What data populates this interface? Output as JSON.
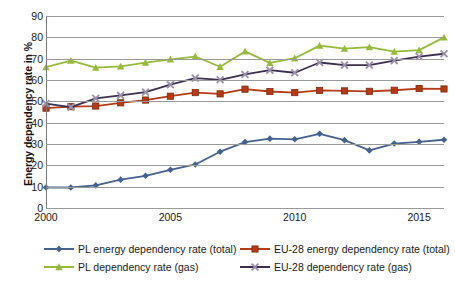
{
  "chart_data": {
    "type": "line",
    "title": "",
    "xlabel": "",
    "ylabel": "Energy dependency rate in %",
    "x": [
      2000,
      2001,
      2002,
      2003,
      2004,
      2005,
      2006,
      2007,
      2008,
      2009,
      2010,
      2011,
      2012,
      2013,
      2014,
      2015,
      2016
    ],
    "xtick_labels": [
      "2000",
      "2005",
      "2010",
      "2015"
    ],
    "xtick_values": [
      2000,
      2005,
      2010,
      2015
    ],
    "ytick_labels": [
      "0",
      "10",
      "20",
      "30",
      "40",
      "50",
      "60",
      "70",
      "80",
      "90"
    ],
    "ytick_values": [
      0,
      10,
      20,
      30,
      40,
      50,
      60,
      70,
      80,
      90
    ],
    "ylim": [
      0,
      90
    ],
    "xlim": [
      2000,
      2016
    ],
    "grid": "horizontal",
    "legend_position": "bottom",
    "series": [
      {
        "name": "PL energy dependency rate (total)",
        "color": "#44618f",
        "marker": "diamond",
        "values": [
          9.6,
          9.6,
          10.6,
          13.3,
          15.1,
          17.9,
          20.4,
          26.4,
          30.9,
          32.5,
          32.2,
          34.8,
          31.8,
          27.0,
          30.2,
          31.0,
          32.0
        ]
      },
      {
        "name": "EU-28 energy dependency rate (total)",
        "color": "#b53a16",
        "marker": "square",
        "values": [
          46.8,
          47.5,
          47.8,
          49.3,
          50.6,
          52.4,
          54.1,
          53.5,
          55.7,
          54.6,
          54.1,
          55.1,
          54.9,
          54.7,
          55.2,
          56.0,
          55.8
        ]
      },
      {
        "name": "PL dependency rate (gas)",
        "color": "#96ba3c",
        "marker": "triangle",
        "values": [
          66.0,
          69.1,
          65.8,
          66.4,
          68.1,
          69.7,
          71.0,
          66.2,
          73.4,
          68.0,
          70.2,
          76.1,
          74.7,
          75.4,
          73.3,
          74.0,
          80.0
        ]
      },
      {
        "name": "EU-28 dependency rate (gas)",
        "color": "#3c3050",
        "marker": "cross",
        "values": [
          48.9,
          47.3,
          51.4,
          52.8,
          54.3,
          57.8,
          60.9,
          60.1,
          62.6,
          64.6,
          63.4,
          68.2,
          67.0,
          67.0,
          69.1,
          71.0,
          72.3
        ]
      }
    ]
  }
}
